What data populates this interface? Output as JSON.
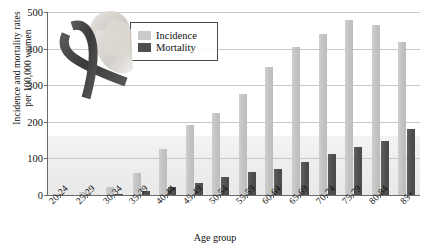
{
  "chart_data": {
    "type": "bar",
    "title": "",
    "xlabel": "Age group",
    "ylabel": "Incidence and mortality rates per 100,000 women",
    "ylabel_line1": "Incidence and mortality rates",
    "ylabel_line2": "per 100,000 women",
    "ylim": [
      0,
      500
    ],
    "yticks": [
      0,
      100,
      200,
      300,
      400,
      500
    ],
    "ytick_labels": [
      "0",
      "100",
      "200",
      "300",
      "400",
      "500"
    ],
    "grid": true,
    "legend_position": "top-left-inside",
    "categories": [
      "20-24",
      "25-29",
      "30-34",
      "35-39",
      "40-44",
      "45-49",
      "50-54",
      "55-59",
      "60-64",
      "65-69",
      "70-74",
      "75-79",
      "80-84",
      "85+"
    ],
    "series": [
      {
        "name": "Incidence",
        "color": "#c6c6c6",
        "values": [
          2,
          8,
          22,
          60,
          125,
          190,
          225,
          275,
          350,
          405,
          440,
          478,
          465,
          418
        ]
      },
      {
        "name": "Mortality",
        "color": "#4f4f4f",
        "values": [
          0,
          1,
          4,
          10,
          22,
          32,
          48,
          62,
          72,
          90,
          112,
          130,
          148,
          180
        ]
      }
    ],
    "decoration": "awareness-ribbon-over-woman-portrait"
  },
  "legend": {
    "items": [
      {
        "label": "Incidence",
        "swatch": "incidence-swatch"
      },
      {
        "label": "Mortality",
        "swatch": "mortality-swatch"
      }
    ]
  }
}
